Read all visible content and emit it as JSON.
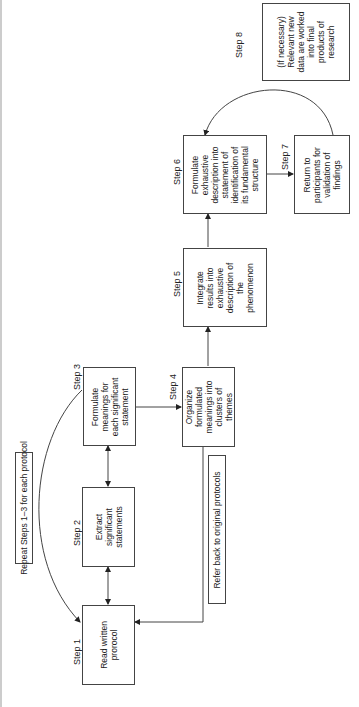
{
  "steps": [
    {
      "id": 1,
      "label": "Step 1",
      "text": "Read written\nprorocol"
    },
    {
      "id": 2,
      "label": "Step 2",
      "text": "Extract\nsignificant\nstatements"
    },
    {
      "id": 3,
      "label": "Step 3",
      "text": "Formulate\nmeanings for\neach significant\nstatement"
    },
    {
      "id": 4,
      "label": "Step 4",
      "text": "Organize\nformulated\nmeanings into\nclusters of\nthemes"
    },
    {
      "id": 5,
      "label": "Step 5",
      "text": "Integrate\nresults into\nexhaustive\ndescription of\nthe\nphenomenon"
    },
    {
      "id": 6,
      "label": "Step 6",
      "text": "Formulate\nexhaustive\ndescription into\nstatement of\nidentification of\nits fundamental\nstructure"
    },
    {
      "id": 7,
      "label": "Step 7",
      "text": "Return to\nparticipants for\nvalidation of\nfindings"
    },
    {
      "id": 8,
      "label": "Step 8",
      "text": "(If necessary)\nRelevant new\ndata are worked\ninto final\nproducts of\nresearch"
    }
  ],
  "notes": {
    "repeat": "Repeat Steps 1–3 for each protocol",
    "refer_back": "Refer back to original protocols"
  },
  "colors": {
    "line": "#444444",
    "border": "#444444",
    "background": "#ffffff"
  }
}
